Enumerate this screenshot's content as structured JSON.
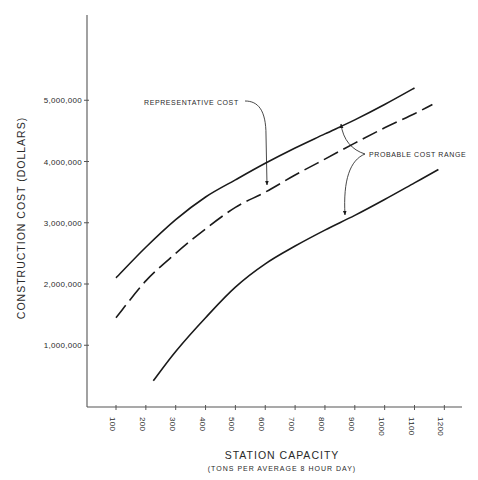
{
  "chart_data": {
    "type": "line",
    "title": "",
    "xlabel": "STATION CAPACITY",
    "xlabel_sub": "(TONS PER AVERAGE 8 HOUR DAY)",
    "ylabel": "CONSTRUCTION COST (DOLLARS)",
    "x_ticks": [
      100,
      200,
      300,
      400,
      500,
      600,
      700,
      800,
      900,
      1000,
      1100,
      1200
    ],
    "x_tick_labels": [
      "100",
      "200",
      "300",
      "400",
      "500",
      "600",
      "700",
      "800",
      "900",
      "1000",
      "1100",
      "1200"
    ],
    "y_ticks": [
      1000000,
      2000000,
      3000000,
      4000000,
      5000000
    ],
    "y_tick_labels": [
      "1,000,000",
      "2,000,000",
      "3,000,000",
      "4,000,000",
      "5,000,000"
    ],
    "xlim": [
      0,
      1260
    ],
    "ylim": [
      0,
      6500000
    ],
    "grid": false,
    "legend": null,
    "series": [
      {
        "name": "Probable cost range (upper bound)",
        "style": "solid",
        "x": [
          100,
          200,
          300,
          400,
          500,
          600,
          700,
          800,
          900,
          1000,
          1100
        ],
        "y": [
          2100000,
          2600000,
          3050000,
          3420000,
          3700000,
          3970000,
          4220000,
          4450000,
          4680000,
          4930000,
          5200000
        ]
      },
      {
        "name": "Representative cost",
        "style": "dashed",
        "x": [
          100,
          200,
          300,
          400,
          500,
          600,
          700,
          800,
          900,
          1000,
          1100,
          1160
        ],
        "y": [
          1450000,
          2050000,
          2500000,
          2900000,
          3250000,
          3500000,
          3780000,
          4040000,
          4300000,
          4550000,
          4780000,
          4930000
        ]
      },
      {
        "name": "Probable cost range (lower bound)",
        "style": "solid",
        "x": [
          225,
          300,
          400,
          500,
          600,
          700,
          800,
          900,
          1000,
          1100,
          1180
        ],
        "y": [
          420000,
          900000,
          1450000,
          1950000,
          2330000,
          2620000,
          2880000,
          3120000,
          3380000,
          3650000,
          3870000
        ]
      }
    ],
    "annotations": [
      {
        "text": "REPRESENTATIVE COST",
        "points_to": "Representative cost",
        "at_x": 610
      },
      {
        "text": "PROBABLE COST RANGE",
        "points_to": [
          "Probable cost range (upper bound)",
          "Probable cost range (lower bound)"
        ],
        "at_x": 850
      }
    ]
  }
}
